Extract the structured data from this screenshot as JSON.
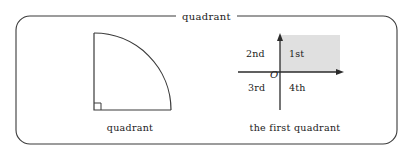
{
  "frame": {
    "legend_label": "quadrant",
    "border_color": "#3a3a3a"
  },
  "figures": [
    {
      "name": "quarter-circle",
      "caption": "quadrant",
      "right_angle_marker": true,
      "stroke_color": "#3a3a3a"
    },
    {
      "name": "coordinate-quadrants",
      "caption": "the first quadrant",
      "origin_label": "O",
      "shaded_quadrant": "1st",
      "shade_color": "#e0e0e0",
      "axis_color": "#2b2b2b",
      "quadrant_labels": {
        "first": "1st",
        "second": "2nd",
        "third": "3rd",
        "fourth": "4th"
      }
    }
  ]
}
